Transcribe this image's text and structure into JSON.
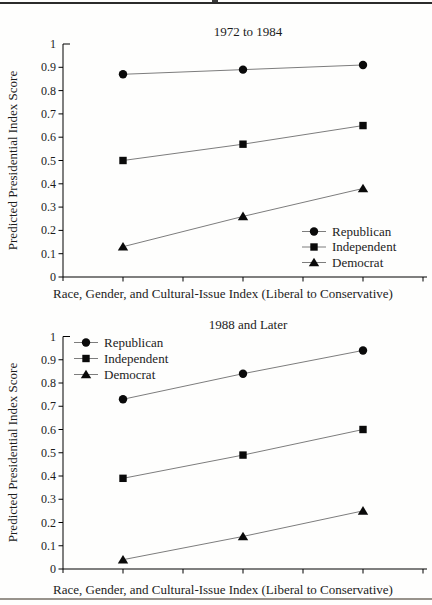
{
  "page": {
    "background": "#fefefd",
    "top_rule_color": "#2b2b2b",
    "bottom_rule_color": "#98938c"
  },
  "shared": {
    "ylabel": "Predicted Presidential Index Score",
    "xlabel": "Race, Gender, and Cultural-Issue Index (Liberal to Conservative)",
    "legend_labels": [
      "Republican",
      "Independent",
      "Democrat"
    ],
    "legend_markers": [
      "circle-icon",
      "square-icon",
      "triangle-icon"
    ],
    "colors": {
      "text": "#1c1c1c",
      "axis": "#000000",
      "series_line": "#7d7d7d",
      "marker": "#0a0a0a"
    }
  },
  "chart_data": [
    {
      "type": "line",
      "title": "1972 to 1984",
      "xlabel": "Race, Gender, and Cultural-Issue Index (Liberal to Conservative)",
      "ylabel": "Predicted Presidential Index Score",
      "ylim": [
        0,
        1
      ],
      "ytick_step": 0.1,
      "ytick_labels": [
        "0",
        "0.1",
        "0.2",
        "0.3",
        "0.4",
        "0.5",
        "0.6",
        "0.7",
        "0.8",
        "0.9",
        "1"
      ],
      "x_axis": {
        "tick_count": 6,
        "tick_labels_shown": false,
        "data_at_tick_indices": [
          1,
          3,
          5
        ]
      },
      "grid": false,
      "legend_position": "bottom-right",
      "series": [
        {
          "name": "Republican",
          "marker": "circle",
          "values": [
            0.87,
            0.89,
            0.91
          ]
        },
        {
          "name": "Independent",
          "marker": "square",
          "values": [
            0.5,
            0.57,
            0.65
          ]
        },
        {
          "name": "Democrat",
          "marker": "triangle",
          "values": [
            0.13,
            0.26,
            0.38
          ]
        }
      ]
    },
    {
      "type": "line",
      "title": "1988 and Later",
      "xlabel": "Race, Gender, and Cultural-Issue Index (Liberal to Conservative)",
      "ylabel": "Predicted Presidential Index Score",
      "ylim": [
        0,
        1
      ],
      "ytick_step": 0.1,
      "ytick_labels": [
        "0",
        "0.1",
        "0.2",
        "0.3",
        "0.4",
        "0.5",
        "0.6",
        "0.7",
        "0.8",
        "0.9",
        "1"
      ],
      "x_axis": {
        "tick_count": 6,
        "tick_labels_shown": false,
        "data_at_tick_indices": [
          1,
          3,
          5
        ]
      },
      "grid": false,
      "legend_position": "top-left",
      "series": [
        {
          "name": "Republican",
          "marker": "circle",
          "values": [
            0.73,
            0.84,
            0.94
          ]
        },
        {
          "name": "Independent",
          "marker": "square",
          "values": [
            0.39,
            0.49,
            0.6
          ]
        },
        {
          "name": "Democrat",
          "marker": "triangle",
          "values": [
            0.04,
            0.14,
            0.25
          ]
        }
      ]
    }
  ]
}
